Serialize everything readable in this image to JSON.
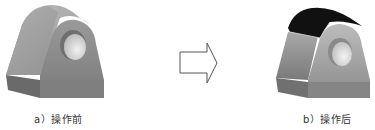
{
  "figure": {
    "before": {
      "caption": "a）操作前",
      "label": "a",
      "text": "操作前"
    },
    "after": {
      "caption": "b）操作后",
      "label": "b",
      "text": "操作后"
    },
    "arrow": {
      "direction": "right",
      "icon": "hollow-right-arrow-icon"
    }
  },
  "colors": {
    "body_face": "#8a8a8a",
    "body_side": "#6e6e6e",
    "body_top": "#a5a5a5",
    "hole": "#e6e6e6",
    "selected_face": "#111111",
    "arrow_stroke": "#555555"
  }
}
